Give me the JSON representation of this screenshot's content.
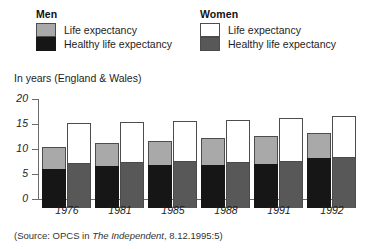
{
  "legend": {
    "men": {
      "title": "Men",
      "items": [
        {
          "label": "Life expectancy",
          "swatch": "#a9a9a9",
          "key": "life-expectancy"
        },
        {
          "label": "Healthy life expectancy",
          "swatch": "#161616",
          "key": "healthy-life-expectancy"
        }
      ]
    },
    "women": {
      "title": "Women",
      "items": [
        {
          "label": "Life expectancy",
          "swatch": "#ffffff",
          "key": "life-expectancy"
        },
        {
          "label": "Healthy life expectancy",
          "swatch": "#585858",
          "key": "healthy-life-expectancy"
        }
      ]
    }
  },
  "axis_caption": "In years (England & Wales)",
  "source": {
    "prefix": "(Source: OPCS in ",
    "publication": "The Independent",
    "suffix": ", 8.12.1995:5)"
  },
  "chart_data": {
    "type": "bar",
    "title": "",
    "subtitle": "",
    "xlabel": "",
    "ylabel": "In years (England & Wales)",
    "ylim": [
      0,
      20
    ],
    "yticks": [
      0,
      5,
      10,
      15,
      20
    ],
    "grid": false,
    "legend_position": "top",
    "stacked": true,
    "categories": [
      "1976",
      "1981",
      "1985",
      "1988",
      "1991",
      "1992"
    ],
    "series": [
      {
        "name": "Men life expectancy",
        "group": "Men",
        "color": "#a9a9a9",
        "values": [
          12.2,
          13.0,
          13.5,
          14.0,
          14.5,
          15.0
        ]
      },
      {
        "name": "Men healthy life expectancy",
        "group": "Men",
        "color": "#161616",
        "values": [
          7.9,
          8.5,
          8.7,
          8.7,
          8.8,
          10.0
        ]
      },
      {
        "name": "Women life expectancy",
        "group": "Women",
        "color": "#ffffff",
        "values": [
          17.0,
          17.3,
          17.5,
          17.7,
          18.0,
          18.4
        ]
      },
      {
        "name": "Women healthy life expectancy",
        "group": "Women",
        "color": "#585858",
        "values": [
          9.0,
          9.2,
          9.4,
          9.3,
          9.5,
          10.2
        ]
      }
    ]
  }
}
